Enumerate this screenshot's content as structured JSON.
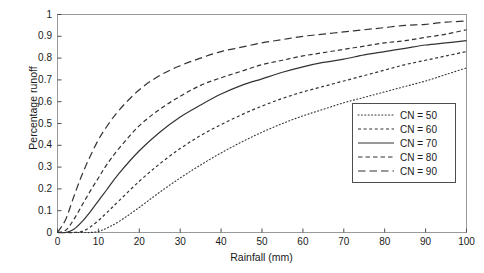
{
  "chart_data": {
    "type": "line",
    "title": "",
    "xlabel": "Rainfall (mm)",
    "ylabel": "Percentage runoff",
    "xlim": [
      0,
      100
    ],
    "ylim": [
      0,
      1
    ],
    "grid": false,
    "legend_position": "lower-right-inside",
    "xticks": [
      0,
      10,
      20,
      30,
      40,
      50,
      60,
      70,
      80,
      90,
      100
    ],
    "xtick_labels": [
      "0",
      "10",
      "20",
      "30",
      "40",
      "50",
      "60",
      "70",
      "80",
      "90",
      "100"
    ],
    "yticks": [
      0,
      0.1,
      0.2,
      0.3,
      0.4,
      0.5,
      0.6,
      0.7,
      0.8,
      0.9,
      1
    ],
    "ytick_labels": [
      "0",
      "0.1",
      "0.2",
      "0.3",
      "0.4",
      "0.5",
      "0.6",
      "0.7",
      "0.8",
      "0.9",
      "1"
    ],
    "x": [
      0,
      2,
      4,
      6,
      8,
      10,
      12,
      15,
      20,
      25,
      30,
      35,
      40,
      45,
      50,
      55,
      60,
      65,
      70,
      75,
      80,
      85,
      90,
      95,
      100
    ],
    "series": [
      {
        "name": "CN = 50",
        "label": "CN = 50",
        "dash": "dotted",
        "color": "#333333",
        "values": [
          0,
          0,
          0,
          0,
          0,
          0.005,
          0.02,
          0.05,
          0.115,
          0.185,
          0.25,
          0.31,
          0.365,
          0.415,
          0.46,
          0.5,
          0.535,
          0.565,
          0.595,
          0.62,
          0.645,
          0.67,
          0.695,
          0.725,
          0.755
        ]
      },
      {
        "name": "CN = 60",
        "label": "CN = 60",
        "dash": "short-dash",
        "color": "#333333",
        "values": [
          0,
          0,
          0,
          0.005,
          0.025,
          0.055,
          0.09,
          0.145,
          0.235,
          0.315,
          0.385,
          0.445,
          0.495,
          0.54,
          0.58,
          0.615,
          0.645,
          0.67,
          0.695,
          0.72,
          0.745,
          0.77,
          0.79,
          0.81,
          0.83
        ]
      },
      {
        "name": "CN = 70",
        "label": "CN = 70",
        "dash": "solid",
        "color": "#333333",
        "values": [
          0,
          0,
          0.015,
          0.05,
          0.095,
          0.145,
          0.195,
          0.27,
          0.375,
          0.46,
          0.53,
          0.585,
          0.635,
          0.675,
          0.705,
          0.735,
          0.76,
          0.78,
          0.795,
          0.815,
          0.83,
          0.845,
          0.86,
          0.87,
          0.88
        ]
      },
      {
        "name": "CN = 80",
        "label": "CN = 80",
        "dash": "medium-dash",
        "color": "#333333",
        "values": [
          0,
          0.01,
          0.06,
          0.125,
          0.19,
          0.25,
          0.31,
          0.385,
          0.49,
          0.565,
          0.625,
          0.675,
          0.71,
          0.74,
          0.77,
          0.79,
          0.81,
          0.825,
          0.84,
          0.855,
          0.87,
          0.88,
          0.895,
          0.91,
          0.93
        ]
      },
      {
        "name": "CN = 90",
        "label": "CN = 90",
        "dash": "long-dash",
        "color": "#333333",
        "values": [
          0,
          0.06,
          0.165,
          0.265,
          0.35,
          0.425,
          0.485,
          0.56,
          0.655,
          0.72,
          0.765,
          0.8,
          0.83,
          0.85,
          0.87,
          0.885,
          0.9,
          0.91,
          0.92,
          0.93,
          0.94,
          0.95,
          0.955,
          0.965,
          0.97
        ]
      }
    ]
  },
  "axes": {
    "frame_color": "#999999",
    "tick_color": "#4d4d4d",
    "text_color": "#1a1a1a"
  }
}
